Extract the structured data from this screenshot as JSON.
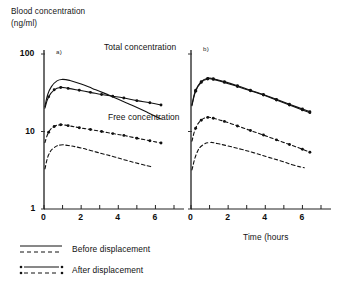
{
  "chart_data": {
    "type": "line",
    "title": "",
    "ylabel": "Blood concentration\n(ng/ml)",
    "ylabel_line1": "Blood concentration",
    "ylabel_line2": "(ng/ml)",
    "xlabel": "Time (hours",
    "yscale": "log",
    "ylim": [
      1,
      100
    ],
    "ytick_labels": [
      "100",
      "10",
      "1"
    ],
    "ytick_values": [
      100,
      10,
      1
    ],
    "xlim": [
      0,
      7
    ],
    "xtick_labels": [
      "0",
      "2",
      "4",
      "6"
    ],
    "xtick_values": [
      0,
      2,
      4,
      6
    ],
    "xticks_minor": [
      1,
      3,
      5,
      7
    ],
    "grid": false,
    "legend_position": "below-plot",
    "annotations": [
      {
        "name": "total-concentration",
        "text": "Total concentration",
        "x": 2.6,
        "y": 78
      },
      {
        "name": "free-concentration",
        "text": "Free concentration",
        "x": 2.9,
        "y": 14.5
      }
    ],
    "panels": [
      {
        "id": "a",
        "label": "a)",
        "series": [
          {
            "name": "Total concentration - before displacement",
            "style": "solid",
            "markers": false,
            "x": [
              0.05,
              0.2,
              0.4,
              0.7,
              1.0,
              1.4,
              2.0,
              2.6,
              3.2,
              4.0,
              4.8,
              5.6,
              6.3
            ],
            "y": [
              21.0,
              30.0,
              38.0,
              45.0,
              47.0,
              45.5,
              41.0,
              36.0,
              31.5,
              26.0,
              21.5,
              17.5,
              14.5
            ]
          },
          {
            "name": "Total concentration - after displacement",
            "style": "solid",
            "markers": true,
            "x": [
              0.05,
              0.25,
              0.55,
              0.9,
              1.3,
              1.9,
              2.5,
              3.1,
              3.7,
              4.3,
              5.0,
              5.7,
              6.3
            ],
            "y": [
              20.0,
              28.0,
              34.5,
              37.0,
              36.0,
              34.0,
              32.0,
              30.0,
              28.5,
              27.0,
              25.0,
              23.5,
              22.0
            ]
          },
          {
            "name": "Free concentration - after displacement",
            "style": "dashed",
            "markers": true,
            "x": [
              0.05,
              0.25,
              0.55,
              0.9,
              1.3,
              1.9,
              2.5,
              3.1,
              3.7,
              4.3,
              5.0,
              5.7,
              6.3
            ],
            "y": [
              7.2,
              9.8,
              11.6,
              12.2,
              11.9,
              11.2,
              10.6,
              10.0,
              9.4,
              8.9,
              8.2,
              7.6,
              7.1
            ]
          },
          {
            "name": "Free concentration - before displacement",
            "style": "dashed",
            "markers": false,
            "x": [
              0.05,
              0.25,
              0.55,
              0.9,
              1.3,
              1.9,
              2.5,
              3.1,
              3.8,
              4.5,
              5.2,
              5.8
            ],
            "y": [
              3.3,
              5.0,
              6.2,
              6.7,
              6.6,
              6.2,
              5.7,
              5.2,
              4.7,
              4.2,
              3.8,
              3.5
            ]
          }
        ]
      },
      {
        "id": "b",
        "label": "b)",
        "series": [
          {
            "name": "Total concentration - before displacement",
            "style": "solid",
            "markers": true,
            "x": [
              0.05,
              0.25,
              0.55,
              0.9,
              1.2,
              1.8,
              2.5,
              3.2,
              3.9,
              4.6,
              5.3,
              6.0,
              6.4
            ],
            "y": [
              22.0,
              34.0,
              44.0,
              48.5,
              48.0,
              44.0,
              39.0,
              34.0,
              30.0,
              26.0,
              22.5,
              19.5,
              18.0
            ]
          },
          {
            "name": "Total concentration - after displacement",
            "style": "solid",
            "markers": true,
            "x": [
              0.05,
              0.25,
              0.55,
              0.9,
              1.2,
              1.8,
              2.5,
              3.2,
              3.9,
              4.6,
              5.3,
              6.0,
              6.4
            ],
            "y": [
              21.5,
              33.0,
              43.0,
              47.5,
              47.0,
              43.0,
              38.0,
              33.5,
              29.5,
              25.5,
              22.0,
              19.0,
              17.5
            ]
          },
          {
            "name": "Free concentration - after displacement",
            "style": "dashed",
            "markers": true,
            "x": [
              0.05,
              0.25,
              0.55,
              0.9,
              1.2,
              1.8,
              2.5,
              3.2,
              3.9,
              4.6,
              5.3,
              6.0,
              6.4
            ],
            "y": [
              7.5,
              11.0,
              14.0,
              15.2,
              14.8,
              13.5,
              11.8,
              10.3,
              9.0,
              7.8,
              6.8,
              5.9,
              5.4
            ]
          },
          {
            "name": "Free concentration - before displacement",
            "style": "dashed",
            "markers": false,
            "x": [
              0.05,
              0.3,
              0.6,
              1.0,
              1.4,
              2.0,
              2.7,
              3.4,
              4.1,
              4.8,
              5.5,
              6.1
            ],
            "y": [
              3.2,
              5.2,
              6.6,
              7.2,
              7.0,
              6.5,
              5.9,
              5.3,
              4.7,
              4.2,
              3.7,
              3.4
            ]
          }
        ]
      }
    ],
    "legend": [
      {
        "name": "before-displacement",
        "label": "Before displacement",
        "solid": true,
        "dashed": true,
        "markers": false
      },
      {
        "name": "after-displacement",
        "label": "After displacement",
        "solid": true,
        "dashed": true,
        "markers": true
      }
    ]
  }
}
